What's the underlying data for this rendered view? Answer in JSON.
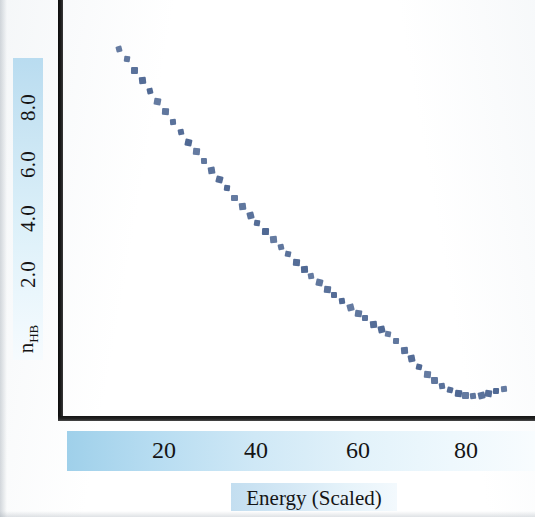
{
  "chart_data": {
    "type": "line",
    "style": "dotted",
    "title": "",
    "subtitle": "",
    "xlabel": "Energy  (Scaled)",
    "ylabel": "n_HB",
    "ylabel_display": "n",
    "ylabel_subscript": "HB",
    "xticks": [
      20,
      40,
      60,
      80
    ],
    "xtick_labels": [
      "20",
      "40",
      "60",
      "80"
    ],
    "yticks": [
      2.0,
      4.0,
      6.0,
      8.0
    ],
    "ytick_labels": [
      "2.0",
      "4.0",
      "6.0",
      "8.0"
    ],
    "xlim": [
      0,
      92
    ],
    "ylim": [
      0,
      9.6
    ],
    "grid": false,
    "legend": null,
    "series": [
      {
        "name": "n_HB vs Energy",
        "color": "#4a6491",
        "marker": "square",
        "x": [
          11.0,
          12.5,
          14.0,
          15.5,
          17.0,
          18.5,
          20.0,
          21.5,
          23.0,
          24.5,
          26.0,
          27.5,
          29.0,
          30.5,
          32.0,
          33.5,
          35.0,
          36.5,
          38.0,
          39.5,
          41.0,
          42.5,
          44.0,
          45.5,
          47.0,
          48.5,
          50.0,
          51.5,
          53.0,
          54.5,
          56.0,
          57.5,
          59.0,
          60.5,
          62.0,
          63.5,
          65.0,
          66.5,
          68.0,
          69.5,
          71.0,
          72.5,
          74.0,
          75.5,
          77.0,
          78.5,
          80.0,
          81.5,
          83.0,
          84.5,
          86.0
        ],
        "y": [
          8.45,
          8.22,
          7.98,
          7.74,
          7.5,
          7.26,
          7.02,
          6.78,
          6.55,
          6.32,
          6.1,
          5.88,
          5.66,
          5.45,
          5.24,
          5.03,
          4.83,
          4.63,
          4.44,
          4.25,
          4.07,
          3.89,
          3.72,
          3.55,
          3.39,
          3.23,
          3.07,
          2.92,
          2.78,
          2.64,
          2.5,
          2.37,
          2.24,
          2.12,
          2.0,
          1.88,
          1.72,
          1.52,
          1.32,
          1.13,
          0.96,
          0.81,
          0.68,
          0.58,
          0.51,
          0.47,
          0.46,
          0.48,
          0.52,
          0.57,
          0.62
        ]
      }
    ],
    "colors": {
      "curve": "#4a6491",
      "axis": "#141414",
      "band_start": "#9fd0ea",
      "band_end": "#f8fcfe",
      "text": "#141414",
      "background": "#ffffff"
    },
    "annotations": []
  }
}
